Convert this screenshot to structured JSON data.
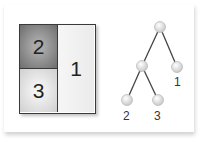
{
  "diagram": {
    "type": "treemap-and-tree",
    "treemap": {
      "cells": [
        {
          "id": "cell-2",
          "label": "2",
          "fill": "#8a8a8a"
        },
        {
          "id": "cell-3",
          "label": "3",
          "fill": "#e2e2e2"
        },
        {
          "id": "cell-1",
          "label": "1",
          "fill": "#f1f1f1"
        }
      ]
    },
    "tree": {
      "nodes": [
        {
          "id": "root",
          "label": ""
        },
        {
          "id": "internal",
          "label": ""
        },
        {
          "id": "leaf-1",
          "label": "1"
        },
        {
          "id": "leaf-2",
          "label": "2"
        },
        {
          "id": "leaf-3",
          "label": "3"
        }
      ],
      "edges": [
        [
          "root",
          "internal"
        ],
        [
          "root",
          "leaf-1"
        ],
        [
          "internal",
          "leaf-2"
        ],
        [
          "internal",
          "leaf-3"
        ]
      ]
    },
    "colors": {
      "node": "#e6e6e6",
      "edge": "#444444",
      "border": "#3a3a3a"
    }
  }
}
